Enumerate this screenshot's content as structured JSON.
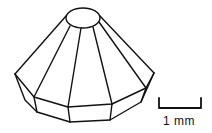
{
  "figure": {
    "colors": {
      "line": "#111111",
      "background": "#ffffff"
    }
  },
  "scale_bar": {
    "label": "1 mm",
    "length_units": "mm",
    "value": 1
  }
}
